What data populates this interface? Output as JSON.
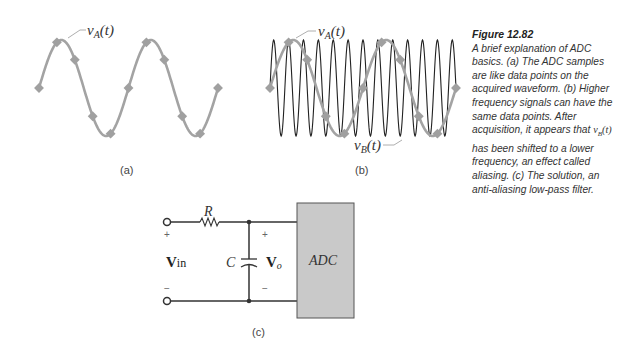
{
  "figure": {
    "number": "Figure 12.82",
    "caption_parts": {
      "prefix": "A brief explanation of ADC basics. (a) The ADC samples are like data points on the acquired waveform. (b) Higher frequency signals can have the same data points. After acquisition, it appears that ",
      "var": "v",
      "var_sub": "B",
      "var_arg": "(t)",
      "suffix": " has been shifted to a lower frequency, an effect called aliasing. (c) The solution, an anti-aliasing low-pass filter."
    }
  },
  "panel_a": {
    "label": "(a)",
    "signal_label": {
      "v": "v",
      "sub": "A",
      "arg": "(t)"
    },
    "wave_color": "#a0a0a0",
    "sample_color": "#a0a0a0"
  },
  "panel_b": {
    "label": "(b)",
    "signal_a_label": {
      "v": "v",
      "sub": "A",
      "arg": "(t)"
    },
    "signal_b_label": {
      "v": "v",
      "sub": "B",
      "arg": "(t)"
    },
    "wave_b_color": "#222222"
  },
  "panel_c": {
    "label": "(c)",
    "resistor": "R",
    "capacitor": "C",
    "vin": {
      "v": "V",
      "sub": "in"
    },
    "vo": {
      "v": "V",
      "sub": "o"
    },
    "plus": "+",
    "minus": "−",
    "adc_label": "ADC",
    "adc_fill": "#c8c8c8"
  },
  "chart_data": {
    "type": "line",
    "series": [
      {
        "name": "vA(t)",
        "description": "low-frequency sine, 2 cycles",
        "cycles": 2
      },
      {
        "name": "vB(t)",
        "description": "high-frequency sine, ~12.5 cycles, same sample points",
        "cycles": 12.5
      }
    ],
    "sample_points_per_cycle_of_vA": 5,
    "sample_count": 11
  }
}
